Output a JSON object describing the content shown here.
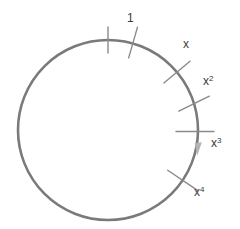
{
  "figure": {
    "name": "cyclic-group-circle-diagram",
    "background_color": "#ffffff",
    "width": 240,
    "height": 229
  },
  "circle": {
    "center_x": 108,
    "center_y": 130,
    "radius": 90,
    "stroke_color": "#7a7a7a",
    "stroke_width": 2.6,
    "fill": "none"
  },
  "direction_arrow": {
    "name": "clockwise-direction-arrow",
    "color": "#b3b3b3",
    "angle_deg": -8,
    "points": "194.9,143.1 201.9,142.2 197.1,155.8"
  },
  "marks": [
    {
      "id": "tick-top-plain",
      "label": "",
      "has_label": false,
      "angle_deg": 90,
      "inner_offset": -13,
      "outer_offset": 13,
      "tick_angle_deg": 90,
      "color": "#8a8a8a",
      "stroke_width": 1.4
    },
    {
      "id": "tick-one",
      "label": "1",
      "has_label": true,
      "angle_deg": 74,
      "inner_offset": -15,
      "outer_offset": 17,
      "tick_angle_deg": 74,
      "color": "#8a8a8a",
      "stroke_width": 1.4,
      "label_x": 127,
      "label_y": 22,
      "superscript": ""
    },
    {
      "id": "tick-x",
      "label": "x",
      "has_label": true,
      "angle_deg": 40,
      "inner_offset": -17,
      "outer_offset": 17,
      "tick_angle_deg": 40,
      "color": "#8a8a8a",
      "stroke_width": 1.4,
      "label_x": 183,
      "label_y": 48,
      "superscript": ""
    },
    {
      "id": "tick-x2",
      "label": "x",
      "has_label": true,
      "angle_deg": 17,
      "inner_offset": -17,
      "outer_offset": 17,
      "tick_angle_deg": 26,
      "color": "#8a8a8a",
      "stroke_width": 1.4,
      "label_x": 203,
      "label_y": 85,
      "superscript": "2"
    },
    {
      "id": "tick-x3",
      "label": "x",
      "has_label": true,
      "angle_deg": -1,
      "inner_offset": -22,
      "outer_offset": 16,
      "tick_angle_deg": 0,
      "color": "#8a8a8a",
      "stroke_width": 1.4,
      "label_x": 211,
      "label_y": 147,
      "superscript": "3"
    },
    {
      "id": "tick-x4",
      "label": "x",
      "has_label": true,
      "angle_deg": -34,
      "inner_offset": -18,
      "outer_offset": 18,
      "tick_angle_deg": -34,
      "color": "#8a8a8a",
      "stroke_width": 1.4,
      "label_x": 194,
      "label_y": 196,
      "superscript": "4"
    }
  ]
}
